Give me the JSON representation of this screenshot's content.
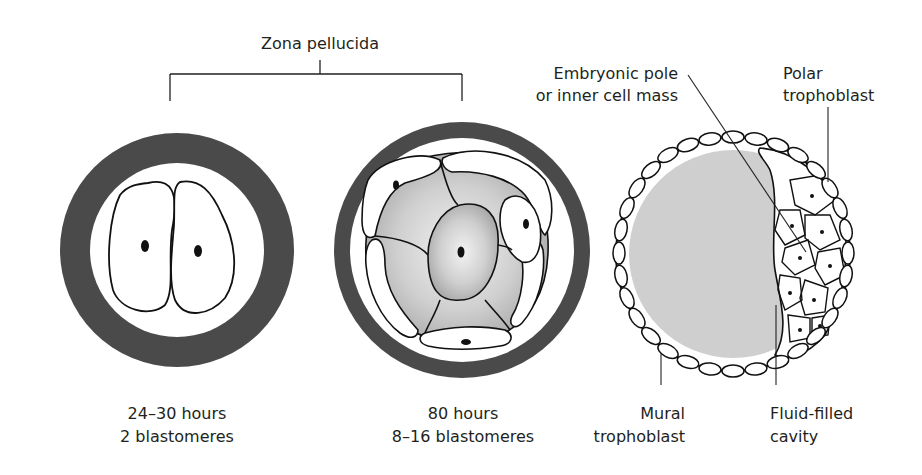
{
  "diagram": {
    "title_bracket_label": "Zona pellucida",
    "stages": [
      {
        "id": "two-cell",
        "line1": "24–30 hours",
        "line2": "2 blastomeres"
      },
      {
        "id": "morula",
        "line1": "80 hours",
        "line2": "8–16 blastomeres"
      },
      {
        "id": "blastocyst"
      }
    ],
    "blastocyst_labels": {
      "embryonic_pole_line1": "Embryonic pole",
      "embryonic_pole_line2": "or inner cell mass",
      "polar_trophoblast_line1": "Polar",
      "polar_trophoblast_line2": "trophoblast",
      "mural_trophoblast_line1": "Mural",
      "mural_trophoblast_line2": "trophoblast",
      "cavity_line1": "Fluid-filled",
      "cavity_line2": "cavity"
    },
    "colors": {
      "zona": "#4a4a4a",
      "cavity": "#cfcfcf",
      "outline": "#1a1a1a",
      "morula_shade": "#bdbdbd"
    }
  }
}
